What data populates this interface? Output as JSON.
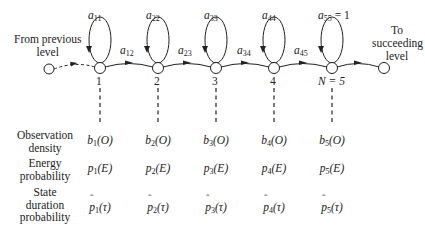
{
  "diagram": {
    "left_label": "From previous level",
    "left_label_lines": [
      "From previous",
      "level"
    ],
    "right_label_lines": [
      "To",
      "succeeding",
      "level"
    ],
    "states": [
      {
        "id": "1",
        "label": "1",
        "self_loop": "a",
        "self_sub": "11",
        "x": 100
      },
      {
        "id": "2",
        "label": "2",
        "self_loop": "a",
        "self_sub": "22",
        "x": 158
      },
      {
        "id": "3",
        "label": "3",
        "self_loop": "a",
        "self_sub": "33",
        "x": 216
      },
      {
        "id": "4",
        "label": "4",
        "self_loop": "a",
        "self_sub": "44",
        "x": 274
      },
      {
        "id": "5",
        "label": "N = 5",
        "self_loop": "a",
        "self_sub": "55",
        "self_suffix": " = 1",
        "x": 332
      }
    ],
    "transitions": [
      {
        "label": "a",
        "sub": "12"
      },
      {
        "label": "a",
        "sub": "23"
      },
      {
        "label": "a",
        "sub": "34"
      },
      {
        "label": "a",
        "sub": "45"
      }
    ],
    "rows": [
      {
        "label_lines": [
          "Observation",
          "density"
        ],
        "cells": [
          {
            "sym": "b",
            "sub": "1",
            "arg": "(O)"
          },
          {
            "sym": "b",
            "sub": "2",
            "arg": "(O)"
          },
          {
            "sym": "b",
            "sub": "3",
            "arg": "(O)"
          },
          {
            "sym": "b",
            "sub": "4",
            "arg": "(O)"
          },
          {
            "sym": "b",
            "sub": "5",
            "arg": "(O)"
          }
        ]
      },
      {
        "label_lines": [
          "Energy",
          "probability"
        ],
        "cells": [
          {
            "sym": "p",
            "sub": "1",
            "arg": "(E)"
          },
          {
            "sym": "p",
            "sub": "2",
            "arg": "(E)"
          },
          {
            "sym": "p",
            "sub": "3",
            "arg": "(E)"
          },
          {
            "sym": "p",
            "sub": "4",
            "arg": "(E)"
          },
          {
            "sym": "p",
            "sub": "5",
            "arg": "(E)"
          }
        ]
      },
      {
        "label_lines": [
          "State",
          "duration",
          "probability"
        ],
        "cells": [
          {
            "sym": "p",
            "sub": "1",
            "arg": "(τ)"
          },
          {
            "sym": "p",
            "sub": "2",
            "arg": "(τ)"
          },
          {
            "sym": "p",
            "sub": "3",
            "arg": "(τ)"
          },
          {
            "sym": "p",
            "sub": "4",
            "arg": "(τ)"
          },
          {
            "sym": "p",
            "sub": "5",
            "arg": "(τ)"
          }
        ]
      }
    ]
  },
  "colors": {
    "stroke": "#222222",
    "background": "#ffffff"
  }
}
